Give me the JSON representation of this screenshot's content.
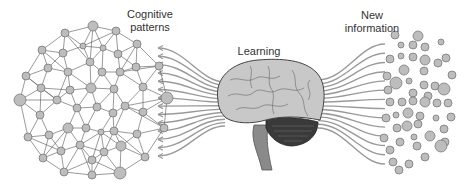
{
  "labels": {
    "cognitive": "Cognitive\npatterns",
    "learning": "Learning",
    "new_info": "New\ninformation"
  },
  "colors": {
    "node_fill": "#bdbdbd",
    "node_stroke": "#6e6e6e",
    "edge": "#555555",
    "fiber": "#9a9a9a",
    "brain_fill": "#c8c8c8",
    "brain_stroke": "#444444",
    "cerebellum": "#3a3a3a",
    "stem": "#8a8a8a",
    "text": "#333333"
  },
  "network": {
    "nodes": [
      [
        93,
        26,
        5
      ],
      [
        65,
        33,
        4
      ],
      [
        116,
        31,
        4
      ],
      [
        42,
        50,
        4
      ],
      [
        63,
        53,
        4
      ],
      [
        83,
        46,
        3
      ],
      [
        103,
        48,
        3
      ],
      [
        118,
        54,
        4
      ],
      [
        137,
        44,
        4
      ],
      [
        26,
        76,
        4
      ],
      [
        48,
        68,
        4
      ],
      [
        68,
        72,
        4
      ],
      [
        90,
        62,
        4
      ],
      [
        102,
        72,
        4
      ],
      [
        120,
        72,
        4
      ],
      [
        136,
        67,
        4
      ],
      [
        159,
        66,
        4
      ],
      [
        20,
        100,
        6
      ],
      [
        41,
        88,
        4
      ],
      [
        70,
        90,
        4
      ],
      [
        91,
        88,
        5
      ],
      [
        114,
        89,
        4
      ],
      [
        143,
        87,
        4
      ],
      [
        167,
        98,
        6
      ],
      [
        40,
        115,
        4
      ],
      [
        57,
        100,
        4
      ],
      [
        77,
        108,
        4
      ],
      [
        97,
        107,
        4
      ],
      [
        113,
        113,
        4
      ],
      [
        125,
        106,
        4
      ],
      [
        143,
        112,
        4
      ],
      [
        28,
        137,
        4
      ],
      [
        49,
        135,
        4
      ],
      [
        68,
        128,
        5
      ],
      [
        86,
        128,
        4
      ],
      [
        101,
        132,
        3
      ],
      [
        114,
        131,
        4
      ],
      [
        137,
        134,
        4
      ],
      [
        164,
        128,
        4
      ],
      [
        43,
        158,
        4
      ],
      [
        61,
        151,
        4
      ],
      [
        80,
        145,
        4
      ],
      [
        92,
        160,
        4
      ],
      [
        104,
        152,
        4
      ],
      [
        121,
        146,
        5
      ],
      [
        145,
        157,
        4
      ],
      [
        64,
        172,
        4
      ],
      [
        92,
        175,
        4
      ],
      [
        120,
        173,
        6
      ]
    ],
    "k": 5
  },
  "fibers": {
    "left_count": 14,
    "right_count": 14
  },
  "dots": [
    [
      395,
      35,
      4
    ],
    [
      418,
      36,
      5
    ],
    [
      401,
      45,
      3
    ],
    [
      413,
      45,
      4
    ],
    [
      425,
      47,
      4
    ],
    [
      441,
      42,
      3
    ],
    [
      390,
      59,
      4
    ],
    [
      401,
      56,
      3
    ],
    [
      413,
      57,
      4
    ],
    [
      425,
      60,
      5
    ],
    [
      438,
      63,
      4
    ],
    [
      446,
      58,
      4
    ],
    [
      404,
      70,
      5
    ],
    [
      424,
      71,
      4
    ],
    [
      452,
      75,
      4
    ],
    [
      387,
      76,
      4
    ],
    [
      396,
      83,
      6
    ],
    [
      409,
      81,
      3
    ],
    [
      424,
      85,
      4
    ],
    [
      435,
      86,
      4
    ],
    [
      388,
      90,
      4
    ],
    [
      413,
      93,
      4
    ],
    [
      428,
      96,
      4
    ],
    [
      444,
      89,
      6
    ],
    [
      390,
      102,
      4
    ],
    [
      402,
      102,
      4
    ],
    [
      413,
      101,
      4
    ],
    [
      425,
      102,
      5
    ],
    [
      437,
      103,
      4
    ],
    [
      448,
      103,
      4
    ],
    [
      386,
      118,
      4
    ],
    [
      396,
      115,
      3
    ],
    [
      408,
      113,
      5
    ],
    [
      420,
      116,
      4
    ],
    [
      436,
      118,
      3
    ],
    [
      451,
      117,
      4
    ],
    [
      397,
      128,
      4
    ],
    [
      407,
      126,
      5
    ],
    [
      418,
      124,
      4
    ],
    [
      444,
      129,
      4
    ],
    [
      384,
      138,
      4
    ],
    [
      400,
      142,
      4
    ],
    [
      414,
      137,
      3
    ],
    [
      430,
      136,
      5
    ],
    [
      445,
      142,
      4
    ],
    [
      390,
      150,
      4
    ],
    [
      417,
      146,
      4
    ],
    [
      441,
      146,
      6
    ],
    [
      425,
      157,
      4
    ],
    [
      393,
      162,
      4
    ],
    [
      409,
      164,
      4
    ],
    [
      399,
      170,
      4
    ]
  ]
}
